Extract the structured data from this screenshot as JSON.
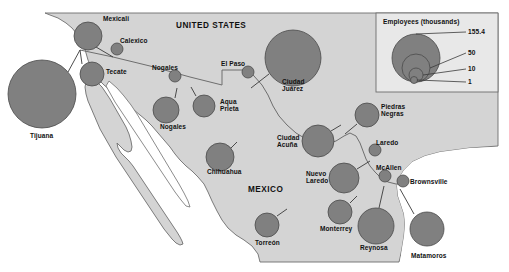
{
  "map": {
    "title_hidden": "",
    "countries": [
      {
        "name": "UNITED STATES",
        "x": 176,
        "y": 22
      },
      {
        "name": "MEXICO",
        "x": 248,
        "y": 186
      }
    ],
    "legend": {
      "title": "Employees (thousands)",
      "values": [
        "155.4",
        "50",
        "10",
        "1"
      ],
      "box": {
        "x": 376,
        "y": 13,
        "w": 122,
        "h": 79
      },
      "circles": [
        {
          "value": "155.4",
          "cx": 416,
          "cy": 58,
          "r": 24
        },
        {
          "value": "50",
          "cx": 416,
          "cy": 68,
          "r": 14
        },
        {
          "value": "10",
          "cx": 416,
          "cy": 75,
          "r": 7
        },
        {
          "value": "1",
          "cx": 414,
          "cy": 80,
          "r": 3.5
        }
      ],
      "leaders": [
        {
          "value": "155.4",
          "x1": 416,
          "y1": 34,
          "x2": 466,
          "y2": 32
        },
        {
          "value": "50",
          "x1": 430,
          "y1": 68,
          "x2": 466,
          "y2": 53
        },
        {
          "value": "10",
          "x1": 423,
          "y1": 75,
          "x2": 466,
          "y2": 69
        },
        {
          "value": "1",
          "x1": 417,
          "y1": 80,
          "x2": 466,
          "y2": 82
        }
      ],
      "label_positions": [
        {
          "value": "155.4",
          "x": 468,
          "y": 28
        },
        {
          "value": "50",
          "x": 468,
          "y": 49
        },
        {
          "value": "10",
          "x": 468,
          "y": 65
        },
        {
          "value": "1",
          "x": 468,
          "y": 78
        }
      ]
    },
    "colors": {
      "land": "#d4d4d4",
      "water": "#ffffff",
      "circle_fill": "#808080",
      "circle_stroke": "#4a4a4a",
      "border": "#6e6e6e",
      "text": "#111111",
      "legend_bg": "#e8e8e8",
      "legend_border": "#6e6e6e"
    },
    "cities": [
      {
        "name": "Tijuana",
        "cx": 42,
        "cy": 94,
        "r": 34,
        "label_x": 30,
        "label_y": 132,
        "leader": [
          68,
          72,
          80,
          50
        ]
      },
      {
        "name": "Mexicali",
        "cx": 88,
        "cy": 36,
        "r": 14,
        "label_x": 103,
        "label_y": 15,
        "leader": [
          96,
          47,
          113,
          57
        ]
      },
      {
        "name": "Calexico",
        "cx": 117,
        "cy": 49,
        "r": 6,
        "label_x": 120,
        "label_y": 37,
        "leader": null
      },
      {
        "name": "Tecate",
        "cx": 92,
        "cy": 74,
        "r": 12,
        "label_x": 106,
        "label_y": 68,
        "leader": [
          82,
          64,
          80,
          50
        ]
      },
      {
        "name": "Nogales",
        "cx": 175,
        "cy": 76,
        "r": 6,
        "label_x": 152,
        "label_y": 64,
        "leader": null
      },
      {
        "name": "Nogales",
        "cx": 166,
        "cy": 110,
        "r": 13,
        "label_x": 160,
        "label_y": 123,
        "leader": [
          175,
          98,
          177,
          88
        ]
      },
      {
        "name": "Aqua\nPrieta",
        "cx": 204,
        "cy": 106,
        "r": 11,
        "label_x": 220,
        "label_y": 98,
        "leader": [
          196,
          96,
          191,
          87
        ]
      },
      {
        "name": "El Paso",
        "cx": 248,
        "cy": 72,
        "r": 6,
        "label_x": 221,
        "label_y": 60,
        "leader": null
      },
      {
        "name": "Ciudad\nJuárez",
        "cx": 293,
        "cy": 58,
        "r": 28,
        "label_x": 282,
        "label_y": 78,
        "leader": [
          269,
          74,
          251,
          88
        ]
      },
      {
        "name": "Chihuahua",
        "cx": 220,
        "cy": 157,
        "r": 14,
        "label_x": 207,
        "label_y": 168,
        "leader": [
          231,
          148,
          237,
          142
        ]
      },
      {
        "name": "Ciudad\nAcuña",
        "cx": 318,
        "cy": 141,
        "r": 16,
        "label_x": 277,
        "label_y": 134,
        "leader": [
          331,
          131,
          341,
          125
        ]
      },
      {
        "name": "Piedras\nNegras",
        "cx": 367,
        "cy": 115,
        "r": 12,
        "label_x": 381,
        "label_y": 103,
        "leader": [
          357,
          124,
          345,
          134
        ]
      },
      {
        "name": "Laredo",
        "cx": 375,
        "cy": 150,
        "r": 6,
        "label_x": 376,
        "label_y": 139,
        "leader": null
      },
      {
        "name": "Nuevo\nLaredo",
        "cx": 344,
        "cy": 178,
        "r": 15,
        "label_x": 306,
        "label_y": 170,
        "leader": [
          357,
          169,
          370,
          161
        ]
      },
      {
        "name": "McAllen",
        "cx": 385,
        "cy": 176,
        "r": 6,
        "label_x": 376,
        "label_y": 164,
        "leader": null
      },
      {
        "name": "Brownsville",
        "cx": 403,
        "cy": 181,
        "r": 6,
        "label_x": 410,
        "label_y": 178,
        "leader": null
      },
      {
        "name": "Monterrey",
        "cx": 340,
        "cy": 212,
        "r": 12,
        "label_x": 320,
        "label_y": 225,
        "leader": [
          350,
          203,
          357,
          196
        ]
      },
      {
        "name": "Reynosa",
        "cx": 376,
        "cy": 226,
        "r": 18,
        "label_x": 360,
        "label_y": 244,
        "leader": [
          379,
          208,
          384,
          186
        ]
      },
      {
        "name": "Matamoros",
        "cx": 427,
        "cy": 229,
        "r": 17,
        "label_x": 411,
        "label_y": 252,
        "leader": [
          414,
          214,
          400,
          189
        ]
      },
      {
        "name": "Torreón",
        "cx": 267,
        "cy": 225,
        "r": 12,
        "label_x": 255,
        "label_y": 239,
        "leader": [
          277,
          216,
          287,
          209
        ]
      }
    ]
  }
}
